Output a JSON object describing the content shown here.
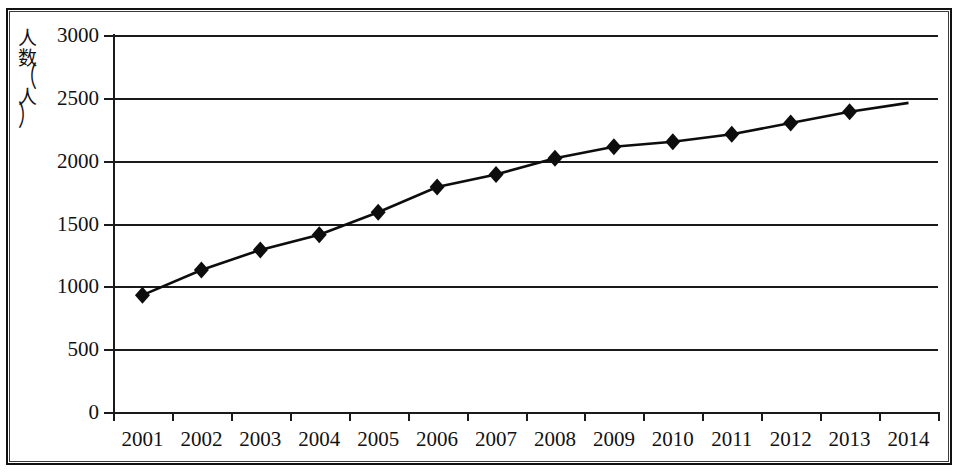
{
  "chart_data": {
    "type": "line",
    "title": "",
    "xlabel": "",
    "ylabel": "人数（人）",
    "ylabel_chars": [
      "人",
      "数",
      "（",
      "人",
      "）"
    ],
    "categories": [
      "2001",
      "2002",
      "2003",
      "2004",
      "2005",
      "2006",
      "2007",
      "2008",
      "2009",
      "2010",
      "2011",
      "2012",
      "2013",
      "2014"
    ],
    "values": [
      930,
      1130,
      1290,
      1410,
      1590,
      1790,
      1890,
      2020,
      2110,
      2150,
      2210,
      2300,
      2390,
      2460
    ],
    "ylim": [
      0,
      3000
    ],
    "ytick_labels": [
      "0",
      "500",
      "1000",
      "1500",
      "2000",
      "2500",
      "3000"
    ],
    "ytick_values": [
      0,
      500,
      1000,
      1500,
      2000,
      2500,
      3000
    ],
    "grid": true,
    "legend": "none",
    "marker": "diamond",
    "line_color": "#0d0d0d",
    "marker_color": "#0d0d0d",
    "grid_color": "#1a1a1a",
    "background": "#ffffff"
  }
}
